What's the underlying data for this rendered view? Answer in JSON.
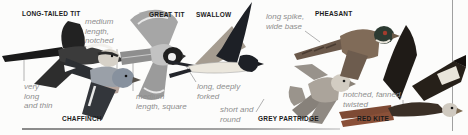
{
  "figure": {
    "birds": [
      {
        "label": "LONG-TAILED TIT",
        "annotation": "very\nlong\nand thin"
      },
      {
        "label": "CHAFFINCH",
        "annotation": "medium\nlength,\nnotched"
      },
      {
        "label": "GREAT TIT",
        "annotation": "medium\nlength, square"
      },
      {
        "label": "SWALLOW",
        "annotation": "long, deeply\nforked"
      },
      {
        "label": "GREY PARTRIDGE",
        "annotation": "short and\nround"
      },
      {
        "label": "PHEASANT",
        "annotation": "long spike,\nwide base"
      },
      {
        "label": "RED KITE",
        "annotation": "notched, fanned,\ntwisted"
      }
    ],
    "palette": {
      "background": "#fcfcfb",
      "label_color": "#1b1b1b",
      "annotation_color": "#8e8e8e",
      "leader_line_color": "#b2b2b2",
      "rule_color": "#9a9a9a",
      "pheasant_face_red": "#a33c2e",
      "red_kite_tail": "#7e4a34",
      "swallow_dark": "#1d2026"
    }
  }
}
